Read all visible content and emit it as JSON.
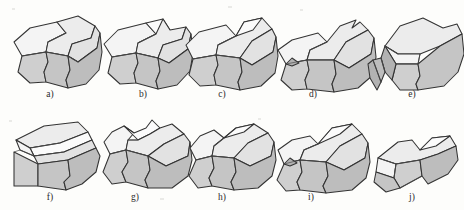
{
  "figure": {
    "kind": "technical-illustration-plate",
    "background_color": "#fdfdfb",
    "line_color": "#333333",
    "palette": {
      "highlight_face": "#f4f4f4",
      "top_face": "#ececec",
      "front_face": "#cfcfcf",
      "side_face": "#bdbdbd",
      "dark_face": "#b2b2b2",
      "white_face": "#fbfbfb"
    },
    "rows": 2,
    "columns": 5,
    "items": [
      {
        "id": "a",
        "label": "a)",
        "label_x": 50,
        "label_y": 97,
        "row": 1,
        "col": 1,
        "note": "base block, smooth wavy front, two-facet top"
      },
      {
        "id": "b",
        "label": "b)",
        "label_x": 143,
        "label_y": 97,
        "row": 1,
        "col": 2,
        "note": "small notch at left top edge"
      },
      {
        "id": "c",
        "label": "c)",
        "label_x": 222,
        "label_y": 97,
        "row": 1,
        "col": 3,
        "note": "clean top, narrow left chamfer"
      },
      {
        "id": "d",
        "label": "d)",
        "label_x": 313,
        "label_y": 97,
        "row": 1,
        "col": 4,
        "note": "notched upper right edge, small left facet"
      },
      {
        "id": "e",
        "label": "e)",
        "label_x": 412,
        "label_y": 97,
        "row": 1,
        "col": 5,
        "note": "stepped serrated left end, broad flat top"
      },
      {
        "id": "f",
        "label": "f)",
        "label_x": 50,
        "label_y": 200,
        "row": 2,
        "col": 1,
        "note": "rotated view, flat lid with recessed channel"
      },
      {
        "id": "g",
        "label": "g)",
        "label_x": 135,
        "label_y": 200,
        "row": 2,
        "col": 2,
        "note": "wavy crest along top, nicked left side"
      },
      {
        "id": "h",
        "label": "h)",
        "label_x": 222,
        "label_y": 200,
        "row": 2,
        "col": 3,
        "note": "shallow S-curve top, open left end"
      },
      {
        "id": "i",
        "label": "i)",
        "label_x": 311,
        "label_y": 200,
        "row": 2,
        "col": 4,
        "note": "diagonal top groove, pointed left corner"
      },
      {
        "id": "j",
        "label": "j)",
        "label_x": 412,
        "label_y": 200,
        "row": 2,
        "col": 5,
        "note": "low flat view, V-shaped saddle in middle"
      }
    ]
  }
}
